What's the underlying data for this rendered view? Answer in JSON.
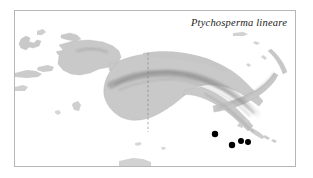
{
  "figure": {
    "kind": "species-distribution-map",
    "region": "New Guinea",
    "species_label": "Ptychosperma lineare",
    "frame": {
      "color": "#b6b6b6"
    },
    "colors": {
      "ocean": "#ffffff",
      "land": "#c9c9c9",
      "land_edge": "#b0b0b0",
      "relief_shadow": "#8e8e8e",
      "border_dashed": "#7a7a7a",
      "point": "#000000",
      "frame": "#b6b6b6",
      "text": "#1c1c1c"
    },
    "border_line": {
      "name": "indonesia-png-border",
      "style": "dashed",
      "x": 147,
      "y_top": 52,
      "y_bottom": 131
    },
    "occurrence_points": [
      {
        "id": 1,
        "x": 214,
        "y": 133,
        "r": 3.2
      },
      {
        "id": 2,
        "x": 231,
        "y": 144,
        "r": 3.2
      },
      {
        "id": 3,
        "x": 240,
        "y": 140,
        "r": 3.0
      },
      {
        "id": 4,
        "x": 247,
        "y": 141,
        "r": 3.0
      }
    ],
    "point_count": 4,
    "landmasses": [
      "New Guinea mainland",
      "Bird's Head Peninsula",
      "Papuan Peninsula",
      "New Britain",
      "New Ireland",
      "Bismarck Archipelago",
      "Halmahera",
      "Seram",
      "Aru Islands",
      "D'Entrecasteaux Islands",
      "Louisiade Archipelago"
    ]
  }
}
